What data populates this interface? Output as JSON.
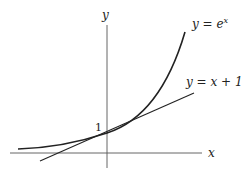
{
  "diagram": {
    "title": "",
    "axes": {
      "x_label": "x",
      "y_label": "y"
    },
    "curves": [
      {
        "name": "exponential",
        "label": "y = e^x",
        "label_display": "y = e",
        "label_sup": "x"
      },
      {
        "name": "tangent-line",
        "label": "y = x + 1"
      }
    ],
    "annotations": {
      "intercept_label": "1"
    },
    "colors": {
      "stroke": "#222222",
      "axis": "#555555",
      "background": "#ffffff"
    }
  }
}
